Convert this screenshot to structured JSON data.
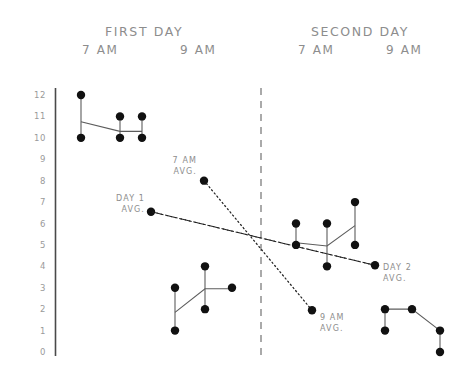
{
  "headers": {
    "first_day": "FIRST  DAY",
    "second_day": "SECOND  DAY",
    "first_day_t1": "7  AM",
    "first_day_t2": "9  AM",
    "second_day_t1": "7  AM",
    "second_day_t2": "9  AM"
  },
  "annotations": {
    "seven_am_avg_l1": "7 AM",
    "seven_am_avg_l2": "AVG.",
    "nine_am_avg_l1": "9 AM",
    "nine_am_avg_l2": "AVG.",
    "day1_avg_l1": "DAY 1",
    "day1_avg_l2": "AVG.",
    "day2_avg_l1": "DAY 2",
    "day2_avg_l2": "AVG."
  },
  "colors": {
    "dot": "#111111",
    "segment": "#5c5c5c",
    "axis": "#4a4a4a",
    "divider": "#8e8e8e",
    "text": "#8d8d8d"
  },
  "chart_data": {
    "type": "scatter",
    "title": "",
    "xlabel": "",
    "ylabel": "",
    "ylim": [
      0,
      12
    ],
    "yticks": [
      12,
      11,
      10,
      9,
      8,
      7,
      6,
      5,
      4,
      3,
      2,
      1,
      0
    ],
    "ytick_labels": [
      "12",
      "11",
      "10",
      "9",
      "8",
      "7",
      "6",
      "5",
      "4",
      "3",
      "2",
      "1",
      "0"
    ],
    "grid": false,
    "legend_position": "none",
    "x_axis_type": "categorical-groups",
    "groups": [
      {
        "name": "FIRST DAY",
        "times": [
          "7 AM",
          "9 AM"
        ]
      },
      {
        "name": "SECOND DAY",
        "times": [
          "7 AM",
          "9 AM"
        ]
      }
    ],
    "divider_x": 261,
    "clusters": [
      {
        "name": "first-day-7am",
        "group": "FIRST DAY",
        "time": "7 AM",
        "points": [
          {
            "x": 81,
            "values": [
              12,
              10
            ]
          },
          {
            "x": 120,
            "values": [
              11,
              10
            ]
          },
          {
            "x": 142,
            "values": [
              11,
              10
            ]
          }
        ],
        "connector_y": [
          10.75,
          10.3,
          10.3
        ]
      },
      {
        "name": "first-day-9am",
        "group": "FIRST DAY",
        "time": "9 AM",
        "points": [
          {
            "x": 175,
            "values": [
              3,
              1
            ]
          },
          {
            "x": 205,
            "values": [
              4,
              2
            ]
          },
          {
            "x": 232,
            "values": [
              3
            ]
          }
        ],
        "connector_y": [
          1.85,
          2.95,
          2.95
        ]
      },
      {
        "name": "second-day-7am",
        "group": "SECOND DAY",
        "time": "7 AM",
        "points": [
          {
            "x": 296,
            "values": [
              6,
              5
            ]
          },
          {
            "x": 327,
            "values": [
              6,
              4
            ]
          },
          {
            "x": 355,
            "values": [
              7,
              5
            ]
          }
        ],
        "connector_y": [
          5.1,
          4.95,
          5.9
        ]
      },
      {
        "name": "second-day-9am",
        "group": "SECOND DAY",
        "time": "9 AM",
        "points": [
          {
            "x": 385,
            "values": [
              2,
              1
            ]
          },
          {
            "x": 412,
            "values": [
              2
            ]
          },
          {
            "x": 440,
            "values": [
              1,
              0
            ]
          }
        ],
        "connector_y": [
          2.0,
          2.0,
          1.0
        ]
      }
    ],
    "trend_lines": [
      {
        "name": "7 AM AVG.",
        "style": "dotted",
        "from": {
          "x": 204,
          "y": 8.0
        },
        "to": {
          "x": 312,
          "y": 1.95
        },
        "marker_at": "from",
        "label_position": "upper-left-of-marker"
      },
      {
        "name": "9 AM AVG.",
        "style": "dotted",
        "from": {
          "x": 312,
          "y": 1.95
        },
        "to": {
          "x": 204,
          "y": 8.0
        },
        "marker_at": "from",
        "label_position": "right-of-marker"
      },
      {
        "name": "DAY 1 AVG.",
        "style": "dash-dot",
        "from": {
          "x": 151,
          "y": 6.55
        },
        "to": {
          "x": 375,
          "y": 4.05
        },
        "marker_at": "from",
        "label_position": "left-of-marker"
      },
      {
        "name": "DAY 2 AVG.",
        "style": "dash-dot",
        "from": {
          "x": 375,
          "y": 4.05
        },
        "to": {
          "x": 151,
          "y": 6.55
        },
        "marker_at": "from",
        "label_position": "right-of-marker"
      }
    ]
  }
}
